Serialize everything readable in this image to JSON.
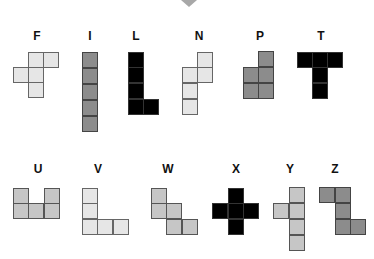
{
  "indicator_icon": "triangle-down-icon",
  "colors": {
    "light": "#e6e6e6",
    "mid": "#c6c6c6",
    "dark": "#8c8c8c",
    "black": "#000000"
  },
  "pieces": [
    {
      "name": "F",
      "label_x": 37,
      "label_y": 30,
      "shade": "light",
      "cells": [
        [
          28,
          52
        ],
        [
          43,
          52
        ],
        [
          13,
          67
        ],
        [
          28,
          67
        ],
        [
          28,
          82
        ]
      ]
    },
    {
      "name": "I",
      "label_x": 90,
      "label_y": 30,
      "shade": "dark",
      "cells": [
        [
          82,
          52
        ],
        [
          82,
          68
        ],
        [
          82,
          84
        ],
        [
          82,
          100
        ],
        [
          82,
          116
        ]
      ]
    },
    {
      "name": "L",
      "label_x": 136,
      "label_y": 30,
      "shade": "black",
      "cells": [
        [
          128,
          52
        ],
        [
          128,
          67
        ],
        [
          128,
          83
        ],
        [
          128,
          99
        ],
        [
          143,
          99
        ]
      ]
    },
    {
      "name": "N",
      "label_x": 199,
      "label_y": 30,
      "shade": "light",
      "cells": [
        [
          197,
          52
        ],
        [
          182,
          67
        ],
        [
          197,
          67
        ],
        [
          182,
          83
        ],
        [
          182,
          99
        ]
      ]
    },
    {
      "name": "P",
      "label_x": 260,
      "label_y": 30,
      "shade": "dark",
      "cells": [
        [
          258,
          51
        ],
        [
          243,
          67
        ],
        [
          258,
          67
        ],
        [
          243,
          83
        ],
        [
          258,
          83
        ]
      ]
    },
    {
      "name": "T",
      "label_x": 321,
      "label_y": 30,
      "shade": "black",
      "cells": [
        [
          297,
          52
        ],
        [
          312,
          52
        ],
        [
          327,
          52
        ],
        [
          312,
          67
        ],
        [
          312,
          83
        ]
      ]
    },
    {
      "name": "U",
      "label_x": 38,
      "label_y": 163,
      "shade": "mid",
      "cells": [
        [
          13,
          188
        ],
        [
          44,
          188
        ],
        [
          13,
          203
        ],
        [
          28,
          203
        ],
        [
          44,
          203
        ]
      ]
    },
    {
      "name": "V",
      "label_x": 98,
      "label_y": 163,
      "shade": "light",
      "cells": [
        [
          82,
          188
        ],
        [
          82,
          203
        ],
        [
          82,
          219
        ],
        [
          97,
          219
        ],
        [
          113,
          219
        ]
      ]
    },
    {
      "name": "W",
      "label_x": 168,
      "label_y": 163,
      "shade": "mid",
      "cells": [
        [
          151,
          188
        ],
        [
          151,
          203
        ],
        [
          166,
          203
        ],
        [
          166,
          219
        ],
        [
          182,
          219
        ]
      ]
    },
    {
      "name": "X",
      "label_x": 236,
      "label_y": 163,
      "shade": "black",
      "cells": [
        [
          228,
          188
        ],
        [
          212,
          203
        ],
        [
          228,
          203
        ],
        [
          243,
          203
        ],
        [
          228,
          219
        ]
      ]
    },
    {
      "name": "Y",
      "label_x": 290,
      "label_y": 163,
      "shade": "mid",
      "cells": [
        [
          289,
          187
        ],
        [
          273,
          203
        ],
        [
          289,
          203
        ],
        [
          289,
          219
        ],
        [
          289,
          235
        ]
      ]
    },
    {
      "name": "Z",
      "label_x": 335,
      "label_y": 163,
      "shade": "dark",
      "cells": [
        [
          319,
          187
        ],
        [
          335,
          187
        ],
        [
          335,
          203
        ],
        [
          335,
          219
        ],
        [
          350,
          219
        ]
      ]
    }
  ]
}
